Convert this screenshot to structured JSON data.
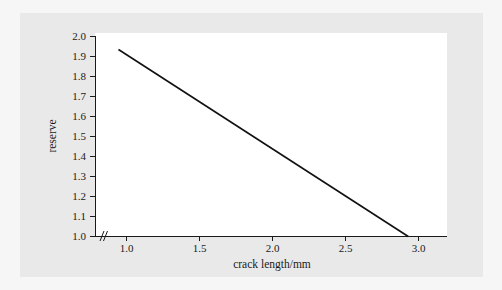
{
  "figure": {
    "background_color": "#f6f6f6",
    "panel_color": "#e9e9e9",
    "plot_background_color": "#ffffff"
  },
  "chart_data": {
    "type": "line",
    "title": "",
    "subtitle": "",
    "xlabel": "crack length/mm",
    "ylabel": "reserve",
    "xlim": [
      0.84,
      3.25
    ],
    "ylim": [
      1.0,
      2.0
    ],
    "xticks": [
      1.0,
      1.5,
      2.0,
      2.5,
      3.0
    ],
    "xtick_labels": [
      "1.0",
      "1.5",
      "2.0",
      "2.5",
      "3.0"
    ],
    "yticks": [
      1.0,
      1.1,
      1.2,
      1.3,
      1.4,
      1.5,
      1.6,
      1.7,
      1.8,
      1.9,
      2.0
    ],
    "ytick_labels": [
      "1.0",
      "1.1",
      "1.2",
      "1.3",
      "1.4",
      "1.5",
      "1.6",
      "1.7",
      "1.8",
      "1.9",
      "2.0"
    ],
    "grid": false,
    "legend": false,
    "legend_position": "none",
    "axis_break": {
      "axis": "x",
      "symbol": "//",
      "position": 0.88
    },
    "series": [
      {
        "name": "reserve",
        "color": "#111111",
        "line_style": "solid",
        "x": [
          0.945,
          2.93
        ],
        "y": [
          1.935,
          1.0
        ]
      }
    ]
  },
  "labels": {
    "x_axis_title": "crack length/mm",
    "y_axis_title": "reserve",
    "x_tick_0": "1.0",
    "x_tick_1": "1.5",
    "x_tick_2": "2.0",
    "x_tick_3": "2.5",
    "x_tick_4": "3.0",
    "y_tick_0": "1.0",
    "y_tick_1": "1.1",
    "y_tick_2": "1.2",
    "y_tick_3": "1.3",
    "y_tick_4": "1.4",
    "y_tick_5": "1.5",
    "y_tick_6": "1.6",
    "y_tick_7": "1.7",
    "y_tick_8": "1.8",
    "y_tick_9": "1.9",
    "y_tick_10": "2.0"
  }
}
